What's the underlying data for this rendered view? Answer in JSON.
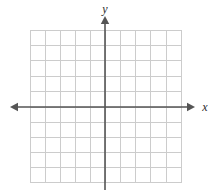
{
  "figure": {
    "kind": "coordinate-plane",
    "width": 212,
    "height": 190,
    "background_color": "#ffffff"
  },
  "labels": {
    "x_axis": "x",
    "y_axis": "y"
  },
  "colors": {
    "grid_line": "#cccccc",
    "grid_border": "#cccccc",
    "axis": "#555555",
    "label_text": "#2b2b2b",
    "background": "#ffffff"
  },
  "chart_data": {
    "type": "scatter",
    "title": "",
    "subtitle": "",
    "xlabel": "x",
    "ylabel": "y",
    "series": [
      {
        "name": "",
        "x": [],
        "y": []
      }
    ],
    "annotations": [],
    "legend": {
      "visible": false,
      "position": "none",
      "entries": []
    },
    "grid": {
      "visible": true,
      "columns": 10,
      "rows": 10,
      "cell_size_px": 15,
      "x_gridlines": [
        30,
        45,
        60,
        75,
        90,
        105,
        120,
        135,
        150,
        166,
        181
      ],
      "y_gridlines": [
        30,
        45,
        60,
        76,
        91,
        107,
        122,
        137,
        152,
        167,
        182
      ]
    },
    "axes": {
      "origin_px": [
        105,
        107
      ],
      "xlim": [
        -5,
        5
      ],
      "ylim": [
        -5,
        5
      ],
      "x_tick_labels": [],
      "y_tick_labels": [],
      "tick_marks_visible": false,
      "x_arrow_left": true,
      "x_arrow_right": true,
      "y_arrow_top": true,
      "y_arrow_bottom": false
    }
  },
  "geometry": {
    "grid": {
      "left": 30,
      "top": 30,
      "right": 181,
      "bottom": 182
    },
    "x_axis": {
      "y": 107,
      "start": 10,
      "end": 195
    },
    "y_axis": {
      "x": 105,
      "start": 16,
      "end": 190
    }
  }
}
